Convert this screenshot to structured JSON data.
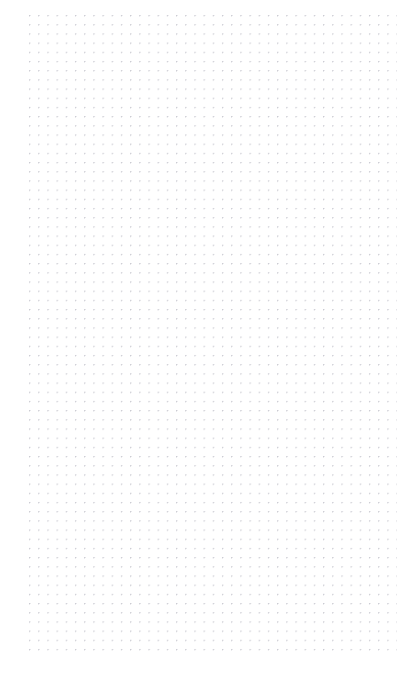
{
  "page": {
    "kind": "dot-grid-notebook-page",
    "width_px": 413,
    "height_px": 674,
    "background_color": "#ffffff",
    "content_text": "",
    "has_text": false,
    "has_icons": false,
    "has_ui_chrome": false
  },
  "grid": {
    "dot_color": "#c8c8d0",
    "dot_radius_px": 0.6,
    "spacing_x_px": 9.2,
    "spacing_y_px": 9.2,
    "origin_x_px": 29,
    "origin_y_px": 15,
    "extent_right_px": 397,
    "extent_bottom_px": 656,
    "columns": 41,
    "rows": 70
  },
  "margins": {
    "left_px": 29,
    "top_px": 15,
    "right_px": 16,
    "bottom_px": 18
  }
}
